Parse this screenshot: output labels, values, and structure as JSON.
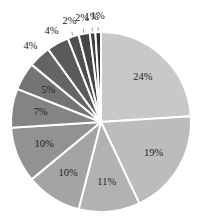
{
  "chart_data": {
    "type": "pie",
    "title": "",
    "start_angle": "12 o'clock",
    "direction": "clockwise",
    "categories": [
      "s1",
      "s2",
      "s3",
      "s4",
      "s5",
      "s6",
      "s7",
      "s8",
      "s9",
      "s10",
      "s11",
      "s12",
      "s13"
    ],
    "values": [
      24,
      19,
      11,
      10,
      10,
      7,
      5,
      4,
      4,
      2,
      2,
      1,
      1
    ],
    "labels": [
      "24%",
      "19%",
      "11%",
      "10%",
      "10%",
      "7%",
      "5%",
      "4%",
      "4%",
      "2%",
      "2%",
      "1%",
      "1%"
    ],
    "colors": [
      "#c8c8c8",
      "#bcbcbc",
      "#b2b2b2",
      "#a4a4a4",
      "#929292",
      "#848484",
      "#747474",
      "#646464",
      "#5a5a5a",
      "#505050",
      "#464646",
      "#3c3c3c",
      "#323232"
    ],
    "legend": "none",
    "label_position": "inside for large slices, outside for small slices"
  },
  "layout": {
    "cx": 101,
    "cy": 122,
    "r": 90,
    "separator_color": "#ffffff"
  }
}
